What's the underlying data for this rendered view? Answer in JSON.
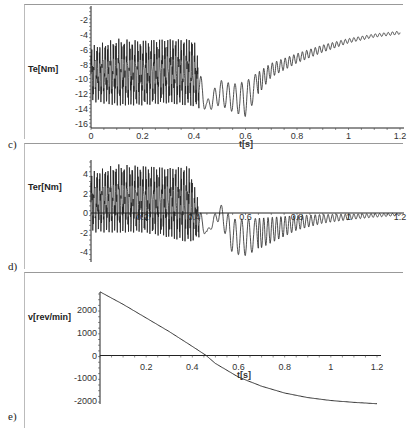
{
  "chart_data": [
    {
      "panel": "c)",
      "type": "line",
      "title": "",
      "xlabel": "t[s]",
      "ylabel": "Te[Nm]",
      "xlim": [
        0,
        1.2
      ],
      "ylim": [
        -16,
        -2
      ],
      "xticks": [
        "0",
        "0.2",
        "0.4",
        "0.6",
        "0.8",
        "1",
        "1.2"
      ],
      "yticks": [
        "-2",
        "-4",
        "-6",
        "-8",
        "-10",
        "-12",
        "-14",
        "-16"
      ],
      "grid": false,
      "description": "Electromagnetic torque: heavy oscillation between about -13 and -4 around -9 for t<0.4, dip to about -14 near t=0.45, oscillations reaching -16 near t=0.6, then recovering smoothly with small ripple toward about -3.5 at t=1.2",
      "envelope": {
        "t": [
          0.0,
          0.1,
          0.2,
          0.3,
          0.4,
          0.45,
          0.5,
          0.55,
          0.6,
          0.65,
          0.7,
          0.8,
          0.9,
          1.0,
          1.1,
          1.2
        ],
        "upper": [
          -5.5,
          -4.5,
          -4.8,
          -4.6,
          -4.6,
          -12.6,
          -9.5,
          -10,
          -9.5,
          -8.5,
          -7.5,
          -6.3,
          -5.2,
          -4.4,
          -3.8,
          -3.4
        ],
        "lower": [
          -13,
          -13.5,
          -13.5,
          -13.2,
          -13.6,
          -14.6,
          -14,
          -15,
          -15.8,
          -12.5,
          -10,
          -8,
          -6.5,
          -5.2,
          -4.4,
          -4.0
        ]
      }
    },
    {
      "panel": "d)",
      "type": "line",
      "title": "",
      "xlabel": "",
      "ylabel": "Ter[Nm]",
      "xlim": [
        0,
        1.2
      ],
      "ylim": [
        -5,
        5.5
      ],
      "xticks": [
        "0.2",
        "0.4",
        "0.6",
        "0.8",
        "1",
        "1.2"
      ],
      "yticks": [
        "4",
        "2",
        "0",
        "-2",
        "-4"
      ],
      "grid": false,
      "description": "Torque ripple: oscillation between about -2 and +5 for t<0.4, dip to about -2.1 near t=0.45, swings to about -5 near t=0.6, then decaying oscillation to near 0 at t=1.2",
      "envelope": {
        "t": [
          0.0,
          0.1,
          0.2,
          0.3,
          0.38,
          0.45,
          0.5,
          0.55,
          0.6,
          0.7,
          0.8,
          0.9,
          1.0,
          1.1,
          1.2
        ],
        "upper": [
          4.2,
          5.0,
          4.8,
          4.6,
          4.8,
          -1.8,
          1.3,
          0.0,
          0.0,
          0.0,
          0.0,
          0.0,
          0.0,
          0.0,
          0.0
        ],
        "lower": [
          -2.0,
          -2.0,
          -2.0,
          -2.5,
          -3.0,
          -2.2,
          -1.0,
          -4.8,
          -5.0,
          -3.5,
          -2.0,
          -1.2,
          -0.8,
          -0.5,
          -0.3
        ]
      }
    },
    {
      "panel": "e)",
      "type": "line",
      "title": "",
      "xlabel": "t[s]",
      "ylabel": "v[rev/min]",
      "xlim": [
        0,
        1.2
      ],
      "ylim": [
        -2200,
        2900
      ],
      "xticks": [
        "0.2",
        "0.4",
        "0.6",
        "0.8",
        "1",
        "1.2"
      ],
      "yticks": [
        "2000",
        "1000",
        "0",
        "-1000",
        "-2000"
      ],
      "grid": false,
      "series": [
        {
          "name": "speed",
          "x": [
            0.0,
            0.1,
            0.2,
            0.3,
            0.4,
            0.46,
            0.5,
            0.6,
            0.7,
            0.8,
            0.9,
            1.0,
            1.1,
            1.2
          ],
          "y": [
            2800,
            2250,
            1650,
            1050,
            400,
            0,
            -350,
            -950,
            -1350,
            -1650,
            -1850,
            -1980,
            -2060,
            -2120
          ]
        }
      ]
    }
  ],
  "panels": {
    "c": {
      "label": "c)",
      "ylabel": "Te[Nm]",
      "xlabel": "t[s]"
    },
    "d": {
      "label": "d)",
      "ylabel": "Ter[Nm]"
    },
    "e": {
      "label": "e)",
      "ylabel": "v[rev/min]",
      "xlabel": "t[s]"
    }
  }
}
